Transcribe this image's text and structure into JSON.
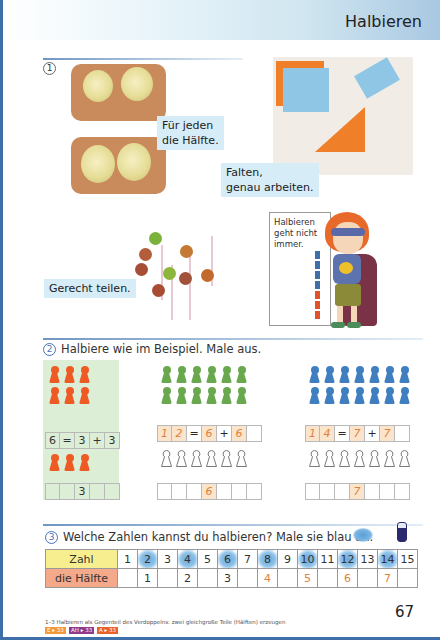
{
  "header": {
    "title": "Halbieren"
  },
  "section1": {
    "number": "1",
    "captions": {
      "apples": [
        "Für jeden",
        "die Hälfte."
      ],
      "folding": [
        "Falten,",
        "genau arbeiten."
      ],
      "lollipops": "Gerecht teilen."
    },
    "poster": {
      "lines": [
        "Halbieren",
        "geht nicht",
        "immer."
      ]
    }
  },
  "section2": {
    "number": "2",
    "instruction": "Halbiere wie im Beispiel. Male aus.",
    "panels": [
      {
        "color": "#ee5a24",
        "total_pawns": 6,
        "equation": [
          "6",
          "=",
          "3",
          "+",
          "3"
        ],
        "half_pawns": 3,
        "half_row": [
          "",
          "",
          "3",
          "",
          ""
        ],
        "is_example": true
      },
      {
        "color": "#6aa84f",
        "total_pawns": 12,
        "equation": [
          "1",
          "2",
          "=",
          "6",
          "+",
          "6",
          ""
        ],
        "half_pawns": 6,
        "half_row": [
          "",
          "",
          "",
          "6",
          "",
          "",
          ""
        ],
        "is_example": false
      },
      {
        "color": "#3f7fc0",
        "total_pawns": 14,
        "equation": [
          "1",
          "4",
          "=",
          "7",
          "+",
          "7",
          ""
        ],
        "half_pawns": 7,
        "half_row": [
          "",
          "",
          "",
          "7",
          "",
          "",
          ""
        ],
        "is_example": false
      }
    ]
  },
  "section3": {
    "number": "3",
    "instruction": "Welche Zahlen kannst du halbieren? Male sie blau an.",
    "table": {
      "row_labels": [
        "Zahl",
        "die Hälfte"
      ],
      "numbers": [
        "1",
        "2",
        "3",
        "4",
        "5",
        "6",
        "7",
        "8",
        "9",
        "10",
        "11",
        "12",
        "13",
        "14",
        "15"
      ],
      "colored_blue": [
        "2",
        "4",
        "6",
        "8",
        "10",
        "12",
        "14"
      ],
      "halves": [
        "",
        "1",
        "",
        "2",
        "",
        "3",
        "",
        "4",
        "",
        "5",
        "",
        "6",
        "",
        "7",
        ""
      ]
    }
  },
  "footer": {
    "note": "1–3 Halbieren als Gegenteil des Verdoppelns: zwei gleichgroße Teile (Hälften) erzeugen",
    "badges": [
      {
        "label": "E ▸ 33",
        "color": "#f29a3a"
      },
      {
        "label": "AH ▸ 33",
        "color": "#8e3b8a"
      },
      {
        "label": "A ▸ 33",
        "color": "#e8622c"
      }
    ],
    "page_number": "67"
  }
}
